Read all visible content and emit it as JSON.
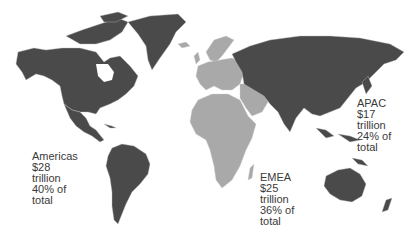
{
  "map": {
    "title": "",
    "colors": {
      "americas": "#4a4a4a",
      "apac": "#4a4a4a",
      "emea": "#a9a9a9",
      "borders": "#bdbdbd",
      "background": "#ffffff"
    },
    "regions": [
      {
        "id": "americas",
        "name": "Americas",
        "value": "$28",
        "unit": "trillion",
        "share": "40% of",
        "share_suffix": "total"
      },
      {
        "id": "emea",
        "name": "EMEA",
        "value": "$25",
        "unit": "trillion",
        "share": "36% of",
        "share_suffix": "total"
      },
      {
        "id": "apac",
        "name": "APAC",
        "value": "$17",
        "unit": "trillion",
        "share": "24% of",
        "share_suffix": "total"
      }
    ]
  }
}
